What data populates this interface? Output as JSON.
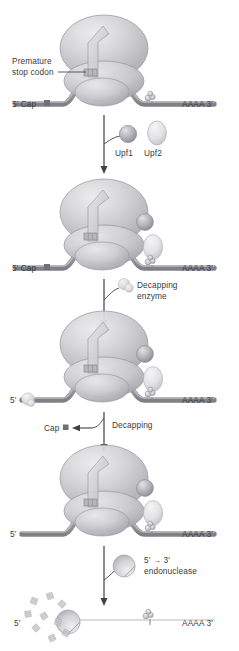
{
  "figure": {
    "background_color": "#ffffff",
    "text_color": "#3a3a3e",
    "mrna_color": "#9a9a9e",
    "ribosome_color": "#c9c9cd",
    "cap_color": "#8a8a8e"
  },
  "panels": [
    {
      "id": "panel-1",
      "name": "premature-stop-codon-recognition",
      "labels": {
        "callout": "Premature\nstop codon",
        "callout_line1": "Premature",
        "callout_line2": "stop codon",
        "five_prime": "5′ Cap",
        "three_prime": "AAAA  3′"
      }
    },
    {
      "id": "panel-2",
      "name": "upf-protein-binding",
      "labels": {
        "five_prime": "5′ Cap",
        "three_prime": "AAAA  3′"
      }
    },
    {
      "id": "panel-3",
      "name": "decapping-enzyme-recruited",
      "labels": {
        "five_prime": "5′",
        "three_prime": "AAAA  3′"
      }
    },
    {
      "id": "panel-4",
      "name": "decapped-mrna",
      "labels": {
        "five_prime": "5′",
        "three_prime": "AAAA  3′"
      }
    },
    {
      "id": "panel-5",
      "name": "mrna-degradation",
      "labels": {
        "five_prime": "5′",
        "three_prime": "AAAA  3′"
      }
    }
  ],
  "annotations": {
    "upf1_label": "Upf1",
    "upf2_label": "Upf2",
    "decapping_enzyme_line1": "Decapping",
    "decapping_enzyme_line2": "enzyme",
    "cap_released_label": "Cap",
    "decapping_step_label": "Decapping",
    "endonuclease_line1": "5′ → 3′",
    "endonuclease_line2": "endonuclease"
  },
  "icons": {
    "arrow_down": "down-arrow",
    "arrow_left": "left-arrow",
    "cap_square": "cap-square-marker",
    "upf1": "upf1-sphere",
    "upf2": "upf2-ellipse",
    "decapping_enzyme": "decapping-enzyme-blob",
    "endonuclease": "pacman-endonuclease",
    "exon_junction_complex": "ejc-spheres",
    "ribosome_large_subunit": "ribosome-large-subunit",
    "ribosome_small_subunit": "ribosome-small-subunit",
    "nascent_peptide": "nascent-peptide-arrow",
    "debris": "mrna-fragment-debris"
  }
}
